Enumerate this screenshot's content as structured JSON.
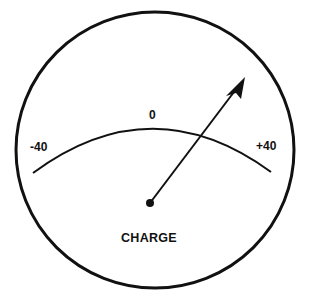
{
  "gauge": {
    "title": "CHARGE",
    "scale": {
      "min_label": "-40",
      "center_label": "0",
      "max_label": "+40",
      "min": -40,
      "max": 40
    },
    "needle": {
      "direction": "toward +40 side",
      "approx_value": 15
    },
    "colors": {
      "ink": "#111111",
      "background": "#ffffff"
    }
  }
}
